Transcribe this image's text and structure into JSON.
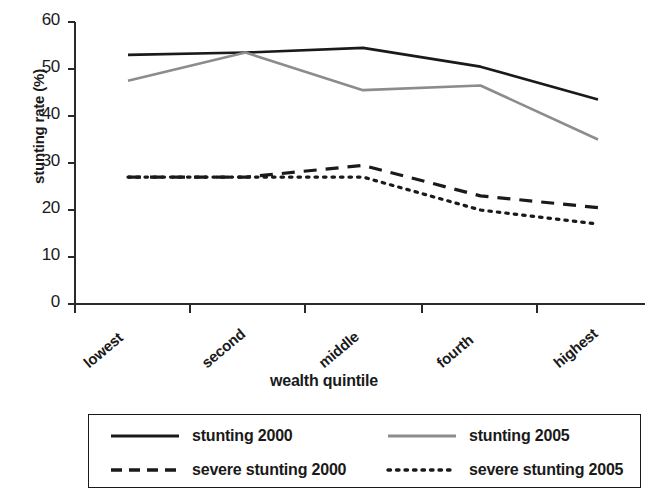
{
  "chart_data": {
    "type": "line",
    "title": "",
    "xlabel": "wealth quintile",
    "ylabel": "stunting rate (%)",
    "categories": [
      "lowest",
      "second",
      "middle",
      "fourth",
      "highest"
    ],
    "xtick_labels": [
      "lowest",
      "second",
      "middle",
      "fourth",
      "highest"
    ],
    "ytick_labels": [
      "0",
      "10",
      "20",
      "30",
      "40",
      "50",
      "60"
    ],
    "yticks": [
      0,
      10,
      20,
      30,
      40,
      50,
      60
    ],
    "ylim": [
      0,
      60
    ],
    "grid": false,
    "legend_position": "below",
    "series": [
      {
        "name": "stunting 2000",
        "style": "solid",
        "color": "#1a1a1a",
        "values": [
          53.0,
          53.5,
          54.5,
          50.5,
          43.5
        ]
      },
      {
        "name": "stunting 2005",
        "style": "solid",
        "color": "#8c8c8c",
        "values": [
          47.5,
          53.5,
          45.5,
          46.5,
          35.0
        ]
      },
      {
        "name": "severe stunting 2000",
        "style": "dashed",
        "color": "#1a1a1a",
        "values": [
          27.0,
          27.0,
          29.5,
          23.0,
          20.5
        ]
      },
      {
        "name": "severe stunting 2005",
        "style": "dotted",
        "color": "#1a1a1a",
        "values": [
          27.0,
          27.0,
          27.0,
          20.0,
          17.0
        ]
      }
    ]
  },
  "legend": {
    "entries": [
      {
        "label": "stunting 2000",
        "style": "solid",
        "color": "#1a1a1a"
      },
      {
        "label": "stunting 2005",
        "style": "solid",
        "color": "#8c8c8c"
      },
      {
        "label": "severe stunting 2000",
        "style": "dashed",
        "color": "#1a1a1a"
      },
      {
        "label": "severe stunting 2005",
        "style": "dotted",
        "color": "#1a1a1a"
      }
    ]
  }
}
